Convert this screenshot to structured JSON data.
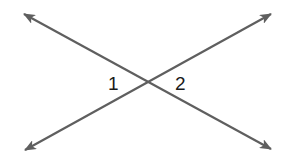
{
  "diagram": {
    "type": "intersecting-lines",
    "line_color": "#5f5f5f",
    "label_color": "#1a1a1a",
    "intersection": {
      "x": 148,
      "y": 83
    },
    "lines": [
      {
        "name": "line-a",
        "from": {
          "x": 24,
          "y": 14
        },
        "to": {
          "x": 271,
          "y": 149
        }
      },
      {
        "name": "line-b",
        "from": {
          "x": 25,
          "y": 150
        },
        "to": {
          "x": 271,
          "y": 14
        }
      }
    ],
    "angles": [
      {
        "label": "1",
        "position": "left"
      },
      {
        "label": "2",
        "position": "right"
      }
    ]
  }
}
